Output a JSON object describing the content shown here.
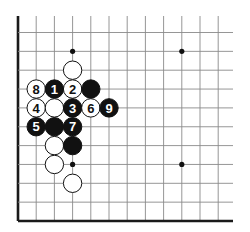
{
  "board": {
    "origin_x": 18,
    "origin_y": 32.5,
    "step_x": 18.2,
    "step_y": 18.85,
    "cols": 12,
    "rows": 11,
    "top_extent_y": 16,
    "right_extent_x": 233,
    "edges": {
      "left": true,
      "bottom": true,
      "top": false,
      "right": false
    },
    "line_color": "#8a8a8a",
    "edge_color": "#1a1a1a",
    "stone_radius": 9.2
  },
  "star_points": [
    {
      "col": 3,
      "row": 1
    },
    {
      "col": 9,
      "row": 1
    },
    {
      "col": 3,
      "row": 7
    },
    {
      "col": 9,
      "row": 7
    }
  ],
  "stones": [
    {
      "color": "white",
      "col": 3,
      "row": 2,
      "label": ""
    },
    {
      "color": "white",
      "col": 1,
      "row": 3,
      "label": "8"
    },
    {
      "color": "black",
      "col": 2,
      "row": 3,
      "label": "1"
    },
    {
      "color": "white",
      "col": 3,
      "row": 3,
      "label": "2"
    },
    {
      "color": "black",
      "col": 4,
      "row": 3,
      "label": ""
    },
    {
      "color": "white",
      "col": 1,
      "row": 4,
      "label": "4"
    },
    {
      "color": "white",
      "col": 2,
      "row": 4,
      "label": ""
    },
    {
      "color": "black",
      "col": 3,
      "row": 4,
      "label": "3"
    },
    {
      "color": "white",
      "col": 4,
      "row": 4,
      "label": "6"
    },
    {
      "color": "black",
      "col": 5,
      "row": 4,
      "label": "9"
    },
    {
      "color": "black",
      "col": 1,
      "row": 5,
      "label": "5"
    },
    {
      "color": "black",
      "col": 2,
      "row": 5,
      "label": ""
    },
    {
      "color": "black",
      "col": 3,
      "row": 5,
      "label": "7"
    },
    {
      "color": "white",
      "col": 2,
      "row": 6,
      "label": ""
    },
    {
      "color": "black",
      "col": 3,
      "row": 6,
      "label": ""
    },
    {
      "color": "white",
      "col": 2,
      "row": 7,
      "label": ""
    },
    {
      "color": "white",
      "col": 3,
      "row": 8,
      "label": ""
    }
  ]
}
